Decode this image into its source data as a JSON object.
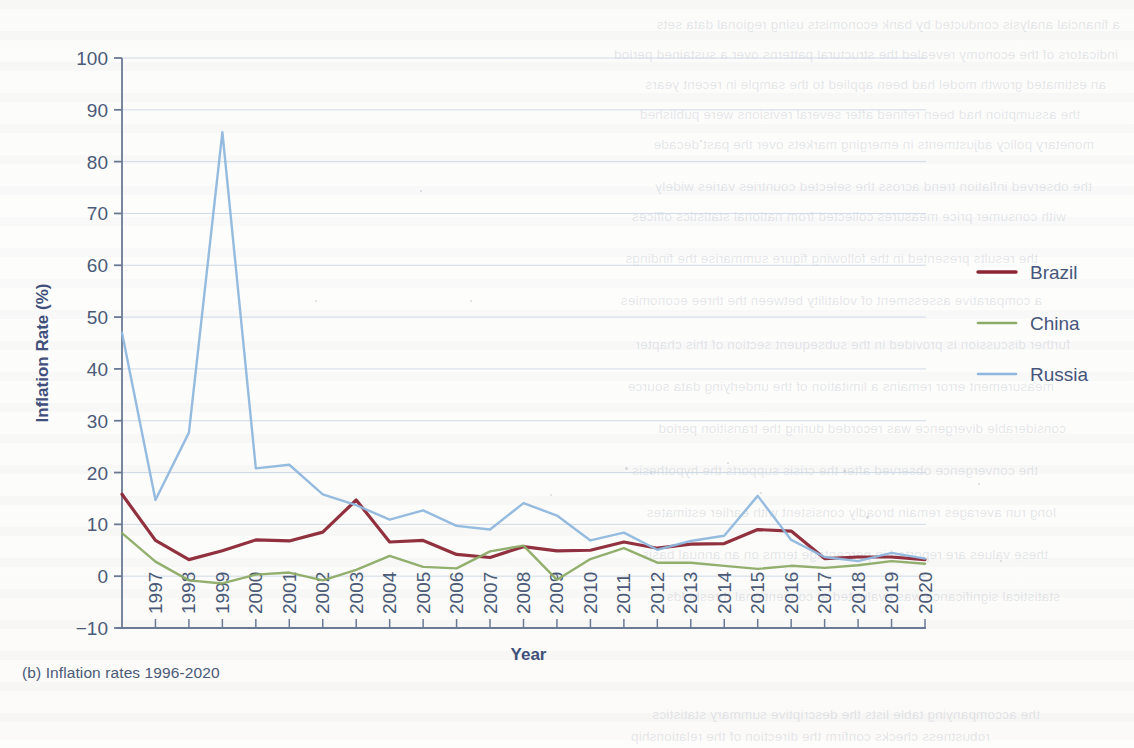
{
  "figure": {
    "caption": "(b) Inflation rates 1996-2020"
  },
  "axes": {
    "ylabel": "Inflation Rate (%)",
    "xlabel": "Year",
    "y_ticks": [
      "100",
      "90",
      "80",
      "70",
      "60",
      "50",
      "40",
      "30",
      "20",
      "10",
      "0",
      "−10"
    ],
    "x_ticks": [
      "1997",
      "1998",
      "1999",
      "2000",
      "2001",
      "2002",
      "2003",
      "2004",
      "2005",
      "2006",
      "2007",
      "2008",
      "2009",
      "2010",
      "2011",
      "2012",
      "2013",
      "2014",
      "2015",
      "2016",
      "2017",
      "2018",
      "2019",
      "2020"
    ]
  },
  "legend": {
    "items": [
      {
        "label": "Brazil",
        "color": "#8b2635"
      },
      {
        "label": "China",
        "color": "#8cab66"
      },
      {
        "label": "Russia",
        "color": "#8fb7dd"
      }
    ]
  },
  "colors": {
    "brazil": "#8b2635",
    "china": "#8cab66",
    "russia": "#8fb7dd",
    "axis": "#6b7a94",
    "grid": "#c9d6e4",
    "text": "#46557a",
    "paper": "#fdfdfc"
  },
  "chart_data": {
    "type": "line",
    "title": "(b) Inflation rates 1996-2020",
    "xlabel": "Year",
    "ylabel": "Inflation Rate (%)",
    "xlim": [
      1996,
      2020
    ],
    "ylim": [
      -10,
      100
    ],
    "ytick_step": 10,
    "grid": true,
    "legend_position": "right",
    "x": [
      1996,
      1997,
      1998,
      1999,
      2000,
      2001,
      2002,
      2003,
      2004,
      2005,
      2006,
      2007,
      2008,
      2009,
      2010,
      2011,
      2012,
      2013,
      2014,
      2015,
      2016,
      2017,
      2018,
      2019,
      2020
    ],
    "series": [
      {
        "name": "Brazil",
        "color": "#8b2635",
        "values": [
          15.8,
          6.9,
          3.2,
          4.9,
          7.0,
          6.8,
          8.5,
          14.7,
          6.6,
          6.9,
          4.2,
          3.6,
          5.7,
          4.9,
          5.0,
          6.6,
          5.4,
          6.2,
          6.3,
          9.0,
          8.7,
          3.4,
          3.7,
          3.7,
          3.2
        ]
      },
      {
        "name": "China",
        "color": "#8cab66",
        "values": [
          8.3,
          2.8,
          -0.8,
          -1.4,
          0.3,
          0.7,
          -0.8,
          1.2,
          3.9,
          1.8,
          1.5,
          4.8,
          5.9,
          -0.7,
          3.3,
          5.4,
          2.6,
          2.6,
          2.0,
          1.4,
          2.0,
          1.6,
          2.1,
          2.9,
          2.4
        ]
      },
      {
        "name": "Russia",
        "color": "#8fb7dd",
        "values": [
          47.0,
          14.7,
          27.7,
          85.7,
          20.8,
          21.5,
          15.8,
          13.7,
          10.9,
          12.7,
          9.7,
          9.0,
          14.1,
          11.7,
          6.9,
          8.4,
          5.1,
          6.8,
          7.8,
          15.5,
          7.0,
          3.7,
          2.9,
          4.5,
          3.4
        ]
      }
    ]
  }
}
